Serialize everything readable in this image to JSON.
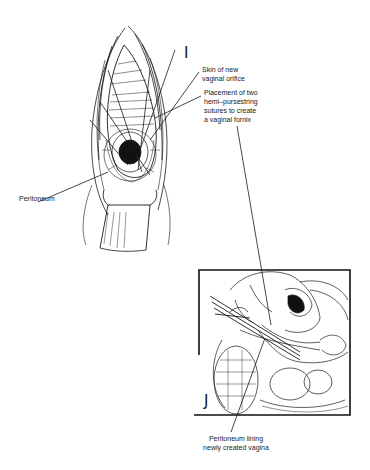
{
  "figure": {
    "panels": [
      {
        "id": "I",
        "letter": "I",
        "description": "Perineal view of new vaginal orifice with retractor and hemi-pursestring sutures",
        "labels": {
          "skin": [
            "Skin of new",
            "vaginal orifice"
          ],
          "sutures": [
            "Placement of two",
            "hemi–pursestring",
            "sutures to create",
            "a vaginal fornix"
          ],
          "peritoneum": "Peritoneum"
        }
      },
      {
        "id": "J",
        "letter": "J",
        "description": "Sagittal pelvic section showing peritoneum lining the neovagina",
        "labels": {
          "lining": [
            "Peritoneum lining",
            "newly created vagina"
          ]
        }
      }
    ],
    "colors": {
      "ink": "#1a1a1a",
      "background": "#ffffff"
    }
  }
}
